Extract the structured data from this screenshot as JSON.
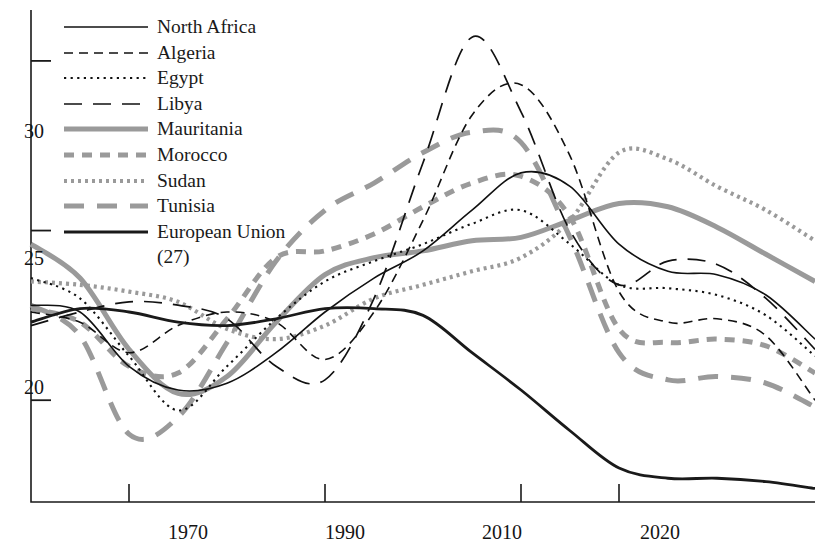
{
  "chart_data": {
    "type": "line",
    "title": "",
    "subtitle": "",
    "xlabel": "",
    "ylabel": "",
    "xlim": [
      1960,
      2040
    ],
    "ylim": [
      17.0,
      31.5
    ],
    "grid": false,
    "legend_position": "top-left",
    "x_ticks": [
      {
        "value": 1970,
        "label": "1970"
      },
      {
        "value": 1990,
        "label": "1990"
      },
      {
        "value": 2010,
        "label": "2010"
      },
      {
        "value": 2020,
        "label": "2020"
      }
    ],
    "y_ticks": [
      {
        "value": 20,
        "label": "20"
      },
      {
        "value": 25,
        "label": "25"
      },
      {
        "value": 30,
        "label": "30"
      }
    ],
    "x": [
      1960,
      1965,
      1970,
      1975,
      1980,
      1985,
      1990,
      1995,
      2000,
      2005,
      2010,
      2015,
      2020,
      2025,
      2030,
      2035,
      2040
    ],
    "series": [
      {
        "name": "North Africa",
        "style": "solid-thin",
        "color": "#111111",
        "width": 1.6,
        "values": [
          22.8,
          22.6,
          21.0,
          20.3,
          20.5,
          21.4,
          22.6,
          23.6,
          24.4,
          25.6,
          26.7,
          26.3,
          24.6,
          23.8,
          23.7,
          23.1,
          21.8
        ]
      },
      {
        "name": "Algeria",
        "style": "dashed",
        "color": "#111111",
        "width": 1.6,
        "values": [
          22.6,
          22.3,
          21.4,
          22.2,
          22.6,
          22.3,
          21.2,
          22.6,
          25.3,
          28.4,
          29.3,
          27.2,
          23.2,
          22.3,
          22.4,
          21.9,
          20.0
        ]
      },
      {
        "name": "Egypt",
        "style": "dotted",
        "color": "#111111",
        "width": 2.1,
        "values": [
          23.6,
          23.0,
          21.3,
          19.7,
          21.0,
          22.4,
          23.5,
          24.1,
          24.6,
          25.2,
          25.6,
          24.6,
          23.4,
          23.3,
          23.1,
          22.5,
          21.3
        ]
      },
      {
        "name": "Libya",
        "style": "longdash",
        "color": "#111111",
        "width": 1.7,
        "values": [
          22.2,
          22.6,
          22.9,
          22.8,
          22.4,
          21.0,
          20.6,
          23.0,
          27.0,
          30.7,
          28.5,
          25.0,
          23.4,
          24.1,
          24.0,
          23.0,
          21.5
        ]
      },
      {
        "name": "Mauritania",
        "style": "solid-thick-gray",
        "color": "#9a9a9a",
        "width": 5.0,
        "values": [
          24.6,
          23.6,
          21.5,
          20.2,
          20.7,
          22.3,
          23.7,
          24.2,
          24.4,
          24.7,
          24.8,
          25.3,
          25.8,
          25.7,
          25.1,
          24.3,
          23.5
        ]
      },
      {
        "name": "Morocco",
        "style": "dashed-thick-gray",
        "color": "#9a9a9a",
        "width": 5.0,
        "values": [
          22.7,
          22.3,
          21.0,
          20.8,
          22.4,
          24.2,
          24.4,
          24.9,
          25.7,
          26.4,
          26.6,
          25.4,
          22.1,
          21.7,
          21.8,
          21.6,
          20.8
        ]
      },
      {
        "name": "Sudan",
        "style": "dotted-gray",
        "color": "#9a9a9a",
        "width": 4.2,
        "values": [
          23.5,
          23.4,
          23.2,
          22.9,
          22.1,
          21.8,
          22.2,
          23.0,
          23.4,
          23.8,
          24.2,
          25.3,
          27.3,
          27.1,
          26.3,
          25.6,
          24.7
        ]
      },
      {
        "name": "Tunisia",
        "style": "longdash-thick-gray",
        "color": "#9a9a9a",
        "width": 5.0,
        "values": [
          22.8,
          21.9,
          19.0,
          19.5,
          21.7,
          24.1,
          25.6,
          26.4,
          27.3,
          27.9,
          27.6,
          24.8,
          21.4,
          20.6,
          20.7,
          20.5,
          19.8
        ]
      },
      {
        "name": "European Union (27)",
        "style": "solid-thick",
        "color": "#1a1a1a",
        "width": 2.8,
        "values": [
          22.3,
          22.7,
          22.6,
          22.3,
          22.2,
          22.4,
          22.7,
          22.7,
          22.5,
          21.4,
          20.3,
          19.1,
          18.0,
          17.7,
          17.7,
          17.6,
          17.4
        ]
      }
    ]
  },
  "legend": {
    "items": [
      {
        "label": "North Africa",
        "key": "line-key-solid-thin"
      },
      {
        "label": "Algeria",
        "key": "line-key-dashed"
      },
      {
        "label": "Egypt",
        "key": "line-key-dotted"
      },
      {
        "label": "Libya",
        "key": "line-key-longdash"
      },
      {
        "label": "Mauritania",
        "key": "line-key-solid-thick-gray"
      },
      {
        "label": "Morocco",
        "key": "line-key-dashed-thick-gray"
      },
      {
        "label": "Sudan",
        "key": "line-key-dotted-gray"
      },
      {
        "label": "Tunisia",
        "key": "line-key-longdash-thick-gray"
      },
      {
        "label": "European Union",
        "key": "line-key-solid-thick"
      }
    ],
    "continuation_label": "(27)"
  },
  "axes": {
    "y_labels": [
      "30",
      "25",
      "20"
    ],
    "x_labels": [
      "1970",
      "1990",
      "2010",
      "2020"
    ]
  },
  "colors": {
    "axis": "#1a1a1a",
    "gray_series": "#9a9a9a",
    "black_series": "#111111",
    "background": "#ffffff"
  }
}
